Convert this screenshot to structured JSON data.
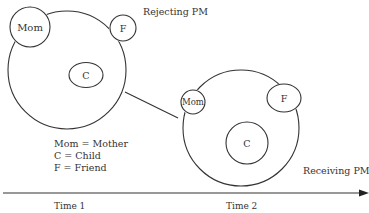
{
  "diagram": {
    "stage1": {
      "title": "Rejecting PM",
      "members": {
        "mother": "Mom",
        "friend": "F",
        "child": "C"
      }
    },
    "stage2": {
      "title": "Receiving PM",
      "members": {
        "mother": "Mom",
        "friend": "F",
        "child": "C"
      }
    },
    "legend": [
      "Mom = Mother",
      "C = Child",
      "F = Friend"
    ],
    "timeline": {
      "labels": [
        "Time 1",
        "Time 2"
      ]
    },
    "colors": {
      "stroke": "#333333",
      "text": "#333333",
      "background": "#ffffff"
    }
  }
}
